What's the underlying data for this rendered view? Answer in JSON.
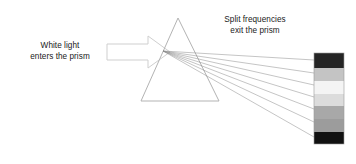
{
  "figure": {
    "background_color": "#ffffff"
  },
  "labels": {
    "white_light": {
      "line1": "White light",
      "line2": "enters the prism",
      "text": "White light\nenters the prism",
      "color": "#1a1a1a"
    },
    "split_frequencies": {
      "line1": "Split frequencies",
      "line2": "exit the prism",
      "text": "Split frequencies\nexit the prism",
      "color": "#1a1a1a"
    }
  },
  "prism": {
    "name": "triangular-prism",
    "apex_x": 178,
    "apex_y": 18,
    "base_left_x": 141,
    "base_right_x": 219,
    "base_y": 101,
    "stroke_color": "#b3b3b3",
    "stroke_width": 1,
    "fill": "none"
  },
  "incoming_arrow": {
    "name": "white-light-arrow",
    "label": "incoming white light beam",
    "stroke_color": "#cfcfcf",
    "fill_color": "#ffffff",
    "shaft_left_x": 107,
    "shaft_right_x": 148,
    "shaft_top_y": 44,
    "shaft_bottom_y": 60,
    "head_tip_x": 170,
    "head_top_y": 36,
    "head_bottom_y": 68
  },
  "refraction_point": {
    "x": 163,
    "y": 51
  },
  "rays": {
    "origin_x": 163,
    "origin_y": 51,
    "stroke_color": "#8a8a8a",
    "stroke_width": 0.5,
    "count": 7,
    "end_x": 314,
    "end_ys": [
      60,
      73,
      85,
      97,
      109,
      122,
      137
    ]
  },
  "spectrum_bar": {
    "name": "spectrum-color-bar",
    "x": 314,
    "y": 53,
    "width": 30,
    "height": 91,
    "border_color": "#9a9a9a",
    "bands": [
      {
        "name": "band-1",
        "color": "#252525",
        "height_px": 15
      },
      {
        "name": "band-2",
        "color": "#c4c4c4",
        "height_px": 13
      },
      {
        "name": "band-3",
        "color": "#f4f4f4",
        "height_px": 13
      },
      {
        "name": "band-4",
        "color": "#dcdcdc",
        "height_px": 12
      },
      {
        "name": "band-5",
        "color": "#a8a8a8",
        "height_px": 13
      },
      {
        "name": "band-6",
        "color": "#9c9c9c",
        "height_px": 13
      },
      {
        "name": "band-7",
        "color": "#111111",
        "height_px": 12
      }
    ]
  }
}
